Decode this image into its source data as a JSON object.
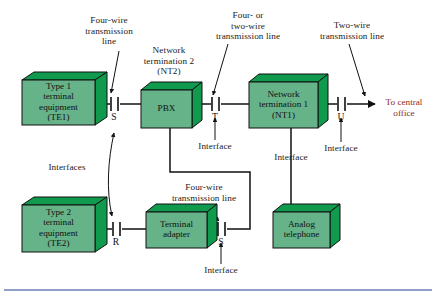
{
  "diagram": {
    "colors": {
      "box_face": "#5aab7e",
      "box_face_light": "#72b894",
      "box_side": "#0f9a4e",
      "box_outline": "#111111",
      "line": "#111111",
      "accent_red": "#8c2b24",
      "rule": "#6b7fb5",
      "background": "#ffffff"
    },
    "boxes": [
      {
        "id": "te1",
        "label": "Type 1\nterminal\nequipment\n(TE1)"
      },
      {
        "id": "pbx",
        "label": "PBX"
      },
      {
        "id": "nt1",
        "label": "Network\ntermination 1\n(NT1)"
      },
      {
        "id": "te2",
        "label": "Type 2\nterminal\nequipment\n(TE2)"
      },
      {
        "id": "ta",
        "label": "Terminal\nadapter"
      },
      {
        "id": "phone",
        "label": "Analog\ntelephone"
      }
    ],
    "annotations": {
      "four_wire_top": "Four-wire\ntransmission\nline",
      "nt2_title": "Network\ntermination 2\n(NT2)",
      "four_or_two_wire": "Four- or\ntwo-wire\ntransmission line",
      "two_wire": "Two-wire\ntransmission line",
      "to_central_office": "To central\noffice",
      "interfaces_plural": "Interfaces",
      "interface_mid": "Interface",
      "interface_nt1": "Interface",
      "interface_phone": "Interface",
      "four_wire_lower": "Four-wire\ntransmission line",
      "interface_lower_s": "Interface"
    },
    "interface_points": [
      {
        "id": "s-upper",
        "letter": "S"
      },
      {
        "id": "t",
        "letter": "T"
      },
      {
        "id": "u",
        "letter": "U"
      },
      {
        "id": "r",
        "letter": "R"
      },
      {
        "id": "s-lower",
        "letter": "S"
      }
    ]
  }
}
